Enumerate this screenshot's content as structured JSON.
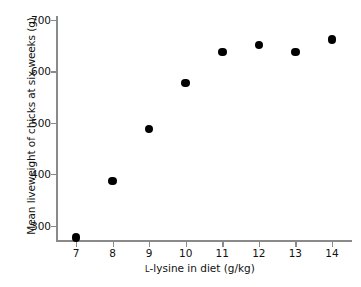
{
  "chart_data": {
    "type": "scatter",
    "title": "",
    "xlabel": "ʟ-lysine in diet (g/kg)",
    "xlabel_prefix": "L",
    "xlabel_rest": "-lysine in diet (g/kg)",
    "ylabel": "Mean liveweight of chicks at six weeks (g)",
    "x": [
      7,
      8,
      9,
      10,
      11,
      12,
      13,
      14
    ],
    "values": [
      277,
      387,
      488,
      578,
      638,
      652,
      638,
      662
    ],
    "xtick_labels": [
      "7",
      "8",
      "9",
      "10",
      "11",
      "12",
      "13",
      "14"
    ],
    "ytick_labels": [
      "300",
      "400",
      "500",
      "600",
      "700"
    ],
    "yticks": [
      300,
      400,
      500,
      600,
      700
    ],
    "xlim": [
      6.45,
      14.55
    ],
    "ylim": [
      268,
      708
    ],
    "grid": false,
    "legend": false,
    "marker": "filled-circle",
    "marker_color": "#000000",
    "axis_color": "#8a8a8a",
    "background_color": "#ffffff"
  }
}
